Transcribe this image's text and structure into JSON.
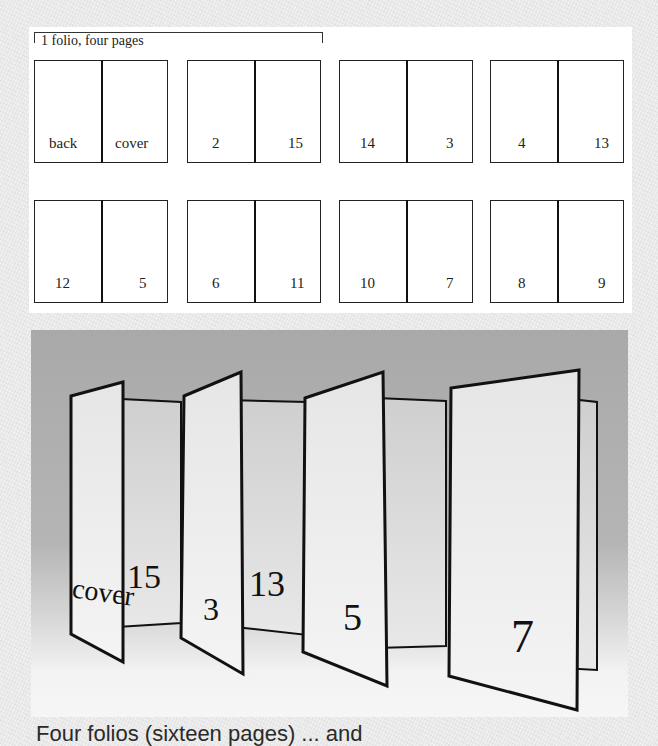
{
  "diagram": {
    "bracket_label": "1 folio, four pages",
    "rows": [
      [
        {
          "left": "back",
          "right": "cover"
        },
        {
          "left": "2",
          "right": "15"
        },
        {
          "left": "14",
          "right": "3"
        },
        {
          "left": "4",
          "right": "13"
        }
      ],
      [
        {
          "left": "12",
          "right": "5"
        },
        {
          "left": "6",
          "right": "11"
        },
        {
          "left": "10",
          "right": "7"
        },
        {
          "left": "8",
          "right": "9"
        }
      ]
    ]
  },
  "photo": {
    "visible_labels": [
      "cover",
      "15",
      "3",
      "13",
      "5",
      "7"
    ]
  },
  "caption": {
    "text": "Four folios (sixteen pages) ... and"
  }
}
